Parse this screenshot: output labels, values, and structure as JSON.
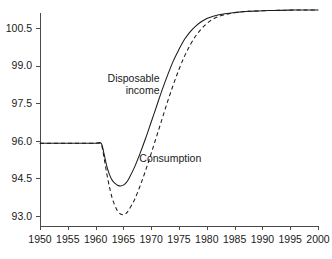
{
  "chart_data": {
    "type": "line",
    "title": "",
    "subtitle": "",
    "xlabel": "",
    "ylabel": "",
    "xlim": [
      1950,
      2000
    ],
    "ylim": [
      92.6,
      101.1
    ],
    "grid": false,
    "legend_position": "inline-annotations",
    "x_ticks": [
      1950,
      1955,
      1960,
      1965,
      1970,
      1975,
      1980,
      1985,
      1990,
      1995,
      2000
    ],
    "y_ticks": [
      93.0,
      94.5,
      96.0,
      97.5,
      99.0,
      100.5
    ],
    "x_tick_labels": [
      "1950",
      "1955",
      "1960",
      "1965",
      "1970",
      "1975",
      "1980",
      "1985",
      "1990",
      "1995",
      "2000"
    ],
    "y_tick_labels": [
      "93.0",
      "94.5",
      "96.0",
      "97.5",
      "99.0",
      "100.5"
    ],
    "annotations": [
      {
        "text_line_1": "Disposable",
        "text_line_2": "income",
        "x": 1971.5,
        "y": 98.35
      },
      {
        "text_line_1": "Consumption",
        "text_line_2": "",
        "x": 1979.0,
        "y": 95.15
      }
    ],
    "series": [
      {
        "name": "Disposable income",
        "style": "solid",
        "x": [
          1950,
          1952,
          1954,
          1956,
          1958,
          1960,
          1961,
          1961.5,
          1962,
          1962.5,
          1963,
          1963.5,
          1964,
          1964.5,
          1965,
          1965.5,
          1966,
          1967,
          1968,
          1969,
          1970,
          1971,
          1972,
          1973,
          1974,
          1975,
          1976,
          1977,
          1978,
          1979,
          1980,
          1981,
          1982,
          1983,
          1984,
          1985,
          1986,
          1987,
          1988,
          1990,
          1992,
          1994,
          1996,
          1998,
          2000
        ],
        "values": [
          95.9,
          95.9,
          95.9,
          95.9,
          95.9,
          95.9,
          95.9,
          95.5,
          95.0,
          94.65,
          94.42,
          94.3,
          94.22,
          94.2,
          94.23,
          94.33,
          94.5,
          94.95,
          95.5,
          96.1,
          96.75,
          97.4,
          98.05,
          98.65,
          99.2,
          99.65,
          100.05,
          100.35,
          100.58,
          100.75,
          100.88,
          100.96,
          101.02,
          101.06,
          101.09,
          101.12,
          101.14,
          101.16,
          101.17,
          101.19,
          101.2,
          101.21,
          101.22,
          101.22,
          101.22
        ]
      },
      {
        "name": "Consumption",
        "style": "dashed",
        "x": [
          1950,
          1952,
          1954,
          1956,
          1958,
          1960,
          1961,
          1961.5,
          1962,
          1962.5,
          1963,
          1963.5,
          1964,
          1964.5,
          1965,
          1965.5,
          1966,
          1967,
          1968,
          1969,
          1970,
          1971,
          1972,
          1973,
          1974,
          1975,
          1976,
          1977,
          1978,
          1979,
          1980,
          1981,
          1982,
          1983,
          1984,
          1985,
          1986,
          1987,
          1988,
          1990,
          1992,
          1994,
          1996,
          1998,
          2000
        ],
        "values": [
          95.9,
          95.9,
          95.9,
          95.9,
          95.9,
          95.9,
          95.85,
          95.35,
          94.7,
          94.15,
          93.7,
          93.4,
          93.18,
          93.08,
          93.05,
          93.1,
          93.25,
          93.65,
          94.2,
          94.82,
          95.5,
          96.2,
          96.9,
          97.6,
          98.25,
          98.85,
          99.38,
          99.82,
          100.18,
          100.46,
          100.68,
          100.84,
          100.95,
          101.02,
          101.07,
          101.11,
          101.14,
          101.16,
          101.17,
          101.19,
          101.2,
          101.21,
          101.22,
          101.22,
          101.22
        ]
      }
    ],
    "colors": {
      "line": "#1a1a1a",
      "axis": "#4a4a4a",
      "background": "#ffffff"
    }
  },
  "geometry": {
    "plot_left": 40,
    "plot_right": 318,
    "plot_top": 13,
    "plot_bottom": 226
  }
}
